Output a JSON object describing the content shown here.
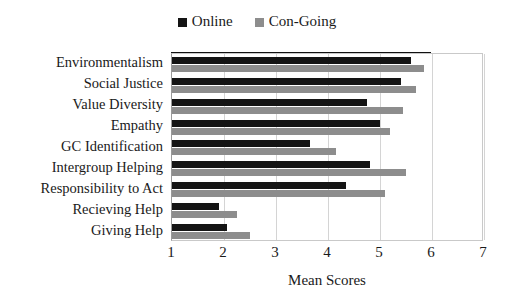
{
  "chart_data": {
    "type": "bar",
    "orientation": "horizontal",
    "title": "",
    "xlabel": "Mean Scores",
    "ylabel": "",
    "xlim": [
      1,
      7
    ],
    "xticks": [
      1,
      2,
      3,
      4,
      5,
      6,
      7
    ],
    "grid": true,
    "legend_position": "top-center",
    "categories": [
      "Environmentalism",
      "Social Justice",
      "Value Diversity",
      "Empathy",
      "GC Identification",
      "Intergroup Helping",
      "Responsibility to Act",
      "Recieving Help",
      "Giving Help"
    ],
    "series": [
      {
        "name": "Online",
        "color": "#141414",
        "values": [
          5.6,
          5.4,
          4.75,
          5.0,
          3.65,
          4.8,
          4.35,
          1.9,
          2.05
        ]
      },
      {
        "name": "Con-Going",
        "color": "#8d8d8d",
        "values": [
          5.85,
          5.7,
          5.45,
          5.2,
          4.15,
          5.5,
          5.1,
          2.25,
          2.5
        ]
      }
    ]
  },
  "legend": {
    "entries": [
      {
        "label": "Online",
        "swatch": "legend-swatch-online"
      },
      {
        "label": "Con-Going",
        "swatch": "legend-swatch-congoing"
      }
    ]
  },
  "axis": {
    "x_title": "Mean Scores"
  }
}
